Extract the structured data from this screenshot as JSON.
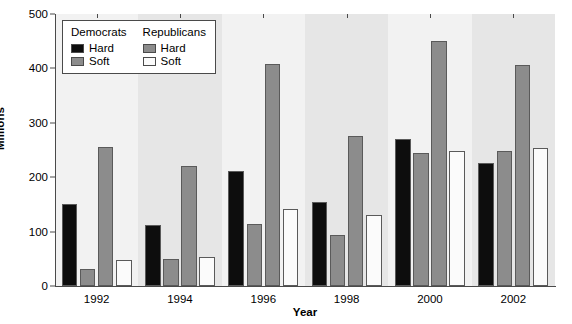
{
  "chart_data": {
    "type": "bar",
    "title": "",
    "xlabel": "Year",
    "ylabel": "Millions",
    "categories": [
      "1992",
      "1994",
      "1996",
      "1998",
      "2000",
      "2002"
    ],
    "series": [
      {
        "name": "Democrats Hard",
        "party": "Democrats",
        "money": "Hard",
        "color": "#0d0d0d",
        "values": [
          150,
          113,
          212,
          154,
          270,
          227
        ]
      },
      {
        "name": "Democrats Soft",
        "party": "Democrats",
        "money": "Soft",
        "color": "#8c8c8c",
        "values": [
          31,
          49,
          114,
          93,
          245,
          249
        ]
      },
      {
        "name": "Republicans Hard",
        "party": "Republicans",
        "money": "Hard",
        "color": "#8c8c8c",
        "values": [
          256,
          221,
          409,
          275,
          450,
          407
        ]
      },
      {
        "name": "Republicans Soft",
        "party": "Republicans",
        "money": "Soft",
        "color": "#fbfbfb",
        "values": [
          48,
          53,
          141,
          130,
          248,
          254
        ]
      }
    ],
    "ylim": [
      0,
      500
    ],
    "yticks": [
      0,
      100,
      200,
      300,
      400,
      500
    ],
    "grid": false,
    "legend_position": "top-left",
    "background_bands": [
      "#f2f2f2",
      "#e6e6e6"
    ]
  },
  "legend": {
    "columns": [
      {
        "header": "Democrats",
        "rows": [
          {
            "label": "Hard",
            "color": "#0d0d0d"
          },
          {
            "label": "Soft",
            "color": "#8c8c8c"
          }
        ]
      },
      {
        "header": "Republicans",
        "rows": [
          {
            "label": "Hard",
            "color": "#8c8c8c"
          },
          {
            "label": "Soft",
            "color": "#fbfbfb"
          }
        ]
      }
    ]
  }
}
